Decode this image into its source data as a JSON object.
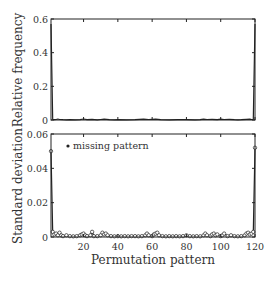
{
  "chart_data": [
    {
      "type": "line",
      "panel": "top",
      "title": "",
      "xlabel": "",
      "ylabel": "Relative frequency",
      "xlim": [
        1,
        120
      ],
      "ylim": [
        0,
        0.6
      ],
      "yticks": [
        0,
        0.2,
        0.4,
        0.6
      ],
      "ytick_labels": [
        "0",
        "0.2",
        "0.4",
        "0.6"
      ],
      "xticks": [
        20,
        40,
        60,
        80,
        100,
        120
      ],
      "show_xtick_labels": false,
      "grid": false,
      "series": [
        {
          "name": "relative frequency",
          "x": [
            1,
            2,
            3,
            4,
            5,
            6,
            8,
            10,
            12,
            15,
            18,
            20,
            22,
            25,
            28,
            30,
            32,
            35,
            38,
            40,
            45,
            50,
            55,
            58,
            60,
            62,
            65,
            70,
            75,
            80,
            85,
            88,
            90,
            92,
            95,
            98,
            100,
            102,
            105,
            108,
            110,
            112,
            115,
            117,
            118,
            119,
            120
          ],
          "values": [
            0.57,
            0.004,
            0.002,
            0.003,
            0.006,
            0.003,
            0.002,
            0.001,
            0.002,
            0.001,
            0.002,
            0.006,
            0.002,
            0.004,
            0.001,
            0.003,
            0.005,
            0.002,
            0.001,
            0.002,
            0.001,
            0.002,
            0.005,
            0.003,
            0.004,
            0.005,
            0.002,
            0.001,
            0.002,
            0.002,
            0.001,
            0.002,
            0.005,
            0.003,
            0.004,
            0.002,
            0.005,
            0.003,
            0.004,
            0.002,
            0.001,
            0.002,
            0.004,
            0.005,
            0.003,
            0.004,
            0.57
          ]
        }
      ]
    },
    {
      "type": "line",
      "panel": "bottom",
      "title": "",
      "xlabel": "Permutation pattern",
      "ylabel": "Standard deviation",
      "xlim": [
        1,
        120
      ],
      "ylim": [
        0,
        0.06
      ],
      "yticks": [
        0,
        0.02,
        0.04,
        0.06
      ],
      "ytick_labels": [
        "0",
        "0.02",
        "0.04",
        "0.06"
      ],
      "xticks": [
        20,
        40,
        60,
        80,
        100,
        120
      ],
      "xtick_labels": [
        "20",
        "40",
        "60",
        "80",
        "100",
        "120"
      ],
      "grid": false,
      "legend": {
        "position": "upper left",
        "entries": [
          "missing pattern"
        ]
      },
      "series": [
        {
          "name": "standard deviation",
          "marker": "open circle",
          "x": [
            1,
            2,
            3,
            4,
            5,
            6,
            7,
            8,
            10,
            12,
            14,
            16,
            18,
            19,
            20,
            21,
            22,
            24,
            25,
            26,
            28,
            30,
            31,
            32,
            33,
            34,
            36,
            38,
            40,
            42,
            44,
            46,
            48,
            50,
            52,
            54,
            56,
            57,
            58,
            60,
            61,
            62,
            63,
            64,
            66,
            68,
            70,
            72,
            74,
            76,
            78,
            80,
            82,
            84,
            86,
            88,
            90,
            91,
            92,
            94,
            95,
            96,
            97,
            98,
            100,
            101,
            102,
            104,
            106,
            108,
            110,
            112,
            114,
            115,
            116,
            117,
            118,
            119,
            120
          ],
          "values": [
            0.05,
            0.003,
            0.0015,
            0.002,
            0.001,
            0.0025,
            0.001,
            0.0005,
            0.001,
            0.0005,
            0.0004,
            0.0005,
            0.001,
            0.0015,
            0.002,
            0.001,
            0.0005,
            0.001,
            0.003,
            0.0005,
            0.0005,
            0.001,
            0.0025,
            0.0015,
            0.002,
            0.001,
            0.0005,
            0.0004,
            0.0005,
            0.0004,
            0.0005,
            0.0004,
            0.0005,
            0.0005,
            0.0004,
            0.0005,
            0.001,
            0.002,
            0.001,
            0.0005,
            0.0015,
            0.002,
            0.0025,
            0.001,
            0.0005,
            0.0004,
            0.0005,
            0.0004,
            0.0005,
            0.0004,
            0.0005,
            0.001,
            0.0005,
            0.0004,
            0.0005,
            0.0004,
            0.001,
            0.002,
            0.001,
            0.0005,
            0.0015,
            0.002,
            0.001,
            0.0015,
            0.0005,
            0.001,
            0.002,
            0.0005,
            0.001,
            0.0005,
            0.0004,
            0.0005,
            0.001,
            0.002,
            0.0025,
            0.0015,
            0.002,
            0.003,
            0.052
          ]
        },
        {
          "name": "missing pattern",
          "marker": "filled dot",
          "x": [],
          "values": []
        }
      ]
    }
  ],
  "labels": {
    "top_ylabel": "Relative frequency",
    "bottom_ylabel": "Standard deviation",
    "xlabel": "Permutation pattern",
    "legend_missing": "missing pattern"
  }
}
